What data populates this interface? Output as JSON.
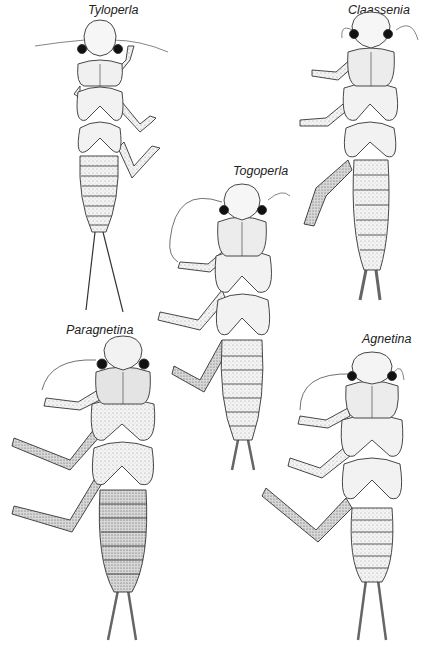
{
  "plate": {
    "background": "#ffffff",
    "ink": "#2a2a2a",
    "specimens": [
      {
        "name": "Tyloperla",
        "label_x": 88,
        "label_y": 3
      },
      {
        "name": "Claassenia",
        "label_x": 348,
        "label_y": 3
      },
      {
        "name": "Togoperla",
        "label_x": 233,
        "label_y": 164
      },
      {
        "name": "Paragnetina",
        "label_x": 66,
        "label_y": 323
      },
      {
        "name": "Agnetina",
        "label_x": 362,
        "label_y": 332
      }
    ]
  }
}
